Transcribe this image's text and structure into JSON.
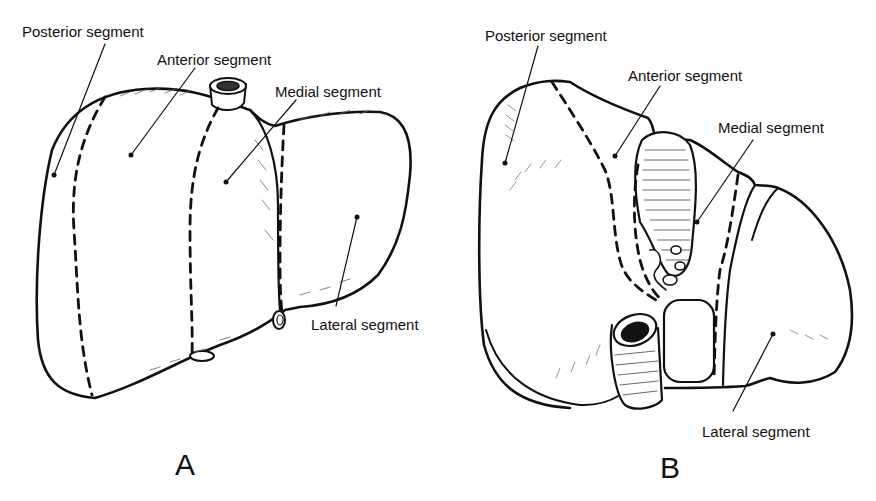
{
  "figure": {
    "panels": [
      {
        "id": "A",
        "letter": "A",
        "view": "anterior",
        "labels": {
          "posterior": "Posterior segment",
          "anterior": "Anterior segment",
          "medial": "Medial segment",
          "lateral": "Lateral segment"
        }
      },
      {
        "id": "B",
        "letter": "B",
        "view": "inferior",
        "labels": {
          "posterior": "Posterior segment",
          "anterior": "Anterior segment",
          "medial": "Medial segment",
          "lateral": "Lateral segment"
        }
      }
    ]
  }
}
